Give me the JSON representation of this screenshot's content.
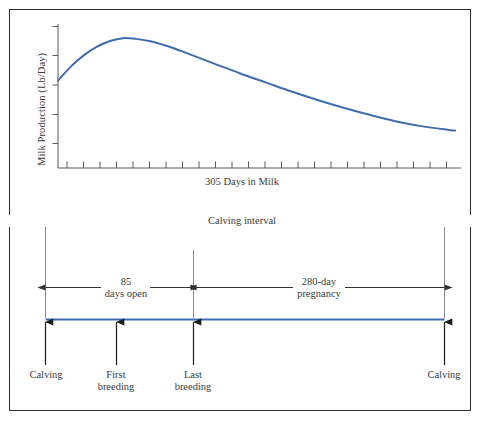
{
  "figure": {
    "frame_color": "#2f2f2f",
    "background": "#ffffff",
    "curve_color": "#3f6daf",
    "axis_color": "#595959",
    "text_color": "#3a3a3a"
  },
  "chart_data": {
    "type": "line",
    "title": "",
    "xlabel": "305 Days in Milk",
    "ylabel": "Milk Production (Lb/Day)",
    "x": [
      0,
      10,
      20,
      30,
      40,
      50,
      60,
      70,
      80,
      90,
      100,
      120,
      140,
      160,
      180,
      200,
      220,
      240,
      260,
      280,
      300,
      305
    ],
    "values": [
      62,
      72,
      80,
      86,
      90,
      92,
      91.5,
      90,
      87.5,
      84.5,
      81,
      74,
      67,
      60.5,
      54,
      48,
      42.5,
      37.5,
      33,
      29.5,
      27,
      26.5
    ],
    "ylim": [
      0,
      100
    ],
    "xlim": [
      0,
      305
    ],
    "grid": false,
    "legend": "none",
    "x_tick_count": 24,
    "y_tick_count": 5,
    "series_name": "Milk production"
  },
  "timeline": {
    "interval_label": "Calving interval",
    "spans": [
      {
        "label_line1": "85",
        "label_line2": "days open",
        "name": "days-open"
      },
      {
        "label_line1": "280-day",
        "label_line2": "pregnancy",
        "name": "pregnancy"
      }
    ],
    "events": [
      {
        "label_line1": "Calving",
        "label_line2": "",
        "name": "calving-start"
      },
      {
        "label_line1": "First",
        "label_line2": "breeding",
        "name": "first-breeding"
      },
      {
        "label_line1": "Last",
        "label_line2": "breeding",
        "name": "last-breeding"
      },
      {
        "label_line1": "Calving",
        "label_line2": "",
        "name": "calving-end"
      }
    ],
    "bar_color": "#3f6daf"
  }
}
